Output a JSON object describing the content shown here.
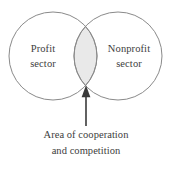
{
  "figure": {
    "type": "venn-diagram",
    "background_color": "#ffffff",
    "stroke_color": "#8a8a8a",
    "overlap_fill_color": "#e9e9e9",
    "text_color": "#3d3d3d",
    "arrow_color": "#3a3a3a"
  },
  "left_circle": {
    "label_line1": "Profit",
    "label_line2": "sector",
    "center_x": 53,
    "center_y": 56,
    "radius": 44
  },
  "right_circle": {
    "label_line1": "Nonprofit",
    "label_line2": "sector",
    "center_x": 118,
    "center_y": 56,
    "radius": 44
  },
  "overlap": {
    "name": "area-of-cooperation-and-competition",
    "top_vertex_y": 24,
    "bottom_vertex_y": 88
  },
  "annotation": {
    "caption_line1": "Area of cooperation",
    "caption_line2": "and competition",
    "arrow_tip_x": 86,
    "arrow_tip_y": 88,
    "arrow_tail_y": 126
  }
}
